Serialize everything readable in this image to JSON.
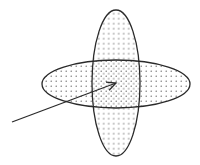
{
  "diagram": {
    "colors": {
      "background": "#ffffff",
      "stroke": "#2a2a2a",
      "dot": "#555555"
    },
    "shapes": [
      {
        "id": "vertical-ellipse",
        "cx": 116,
        "cy": 83,
        "rx": 24,
        "ry": 73
      },
      {
        "id": "horizontal-ellipse",
        "cx": 116,
        "cy": 84,
        "rx": 74,
        "ry": 24
      }
    ],
    "arrow": {
      "x1": 12,
      "y1": 122,
      "x2": 116,
      "y2": 83
    },
    "intersection_label": "intersection"
  }
}
